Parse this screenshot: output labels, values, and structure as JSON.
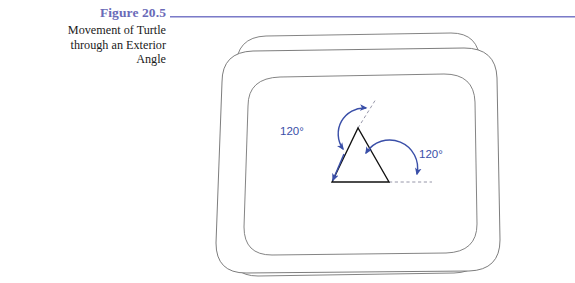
{
  "figure": {
    "number_label": "Figure 20.5",
    "caption_lines": [
      "Movement of Turtle",
      "through an Exterior",
      "Angle"
    ],
    "accent_color": "#6a6ab8",
    "rule_color": "#7b7bc8",
    "caption_color": "#1a1a1a"
  },
  "illustration": {
    "kind": "turtle-graphics-on-tv-screen",
    "outline_color": "#6b6b6b",
    "annotation_color": "#3a4fa8",
    "shape_color": "#111111",
    "angle_labels": [
      {
        "id": "apex-exterior-angle",
        "text": "120°"
      },
      {
        "id": "base-right-exterior-angle",
        "text": "120°"
      }
    ],
    "polygon": {
      "name": "equilateral-triangle",
      "vertices": [
        {
          "x": 332,
          "y": 182
        },
        {
          "x": 358,
          "y": 128
        },
        {
          "x": 389,
          "y": 182
        }
      ]
    },
    "dashed_extensions": [
      {
        "id": "apex-heading-extension",
        "from": {
          "x": 358,
          "y": 128
        },
        "to": {
          "x": 376,
          "y": 99
        }
      },
      {
        "id": "base-heading-extension",
        "from": {
          "x": 389,
          "y": 182
        },
        "to": {
          "x": 431,
          "y": 182
        }
      }
    ]
  }
}
